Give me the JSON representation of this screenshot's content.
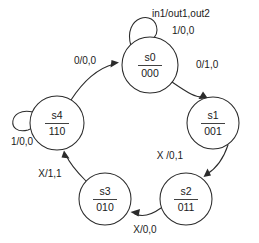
{
  "diagram": {
    "kind": "finite-state-machine",
    "title": "",
    "legend": {
      "format_label": "in1/out1,out2"
    },
    "colors": {
      "stroke": "#2b2b2b",
      "text": "#1a1a1a",
      "background": "#ffffff"
    },
    "states": [
      {
        "id": "s0",
        "name": "s0",
        "code": "000",
        "cx": 150,
        "cy": 65,
        "r": 28
      },
      {
        "id": "s1",
        "name": "s1",
        "code": "001",
        "cx": 213,
        "cy": 123,
        "r": 26
      },
      {
        "id": "s2",
        "name": "s2",
        "code": "011",
        "cx": 186,
        "cy": 199,
        "r": 26
      },
      {
        "id": "s3",
        "name": "s3",
        "code": "010",
        "cx": 105,
        "cy": 199,
        "r": 26
      },
      {
        "id": "s4",
        "name": "s4",
        "code": "110",
        "cx": 57,
        "cy": 123,
        "r": 27
      }
    ],
    "transitions": [
      {
        "id": "t-s0-s0",
        "from": "s0",
        "to": "s0",
        "label": "1/0,0",
        "label_x": 172,
        "label_y": 31,
        "self_loop": true
      },
      {
        "id": "t-s0-s1",
        "from": "s0",
        "to": "s1",
        "label": "0/1,0",
        "label_x": 196,
        "label_y": 65,
        "self_loop": false
      },
      {
        "id": "t-s1-s2",
        "from": "s1",
        "to": "s2",
        "label": "X /0,1",
        "label_x": 183,
        "label_y": 156,
        "self_loop": false
      },
      {
        "id": "t-s2-s3",
        "from": "s2",
        "to": "s3",
        "label": "X/0,0",
        "label_x": 145,
        "label_y": 230,
        "self_loop": false
      },
      {
        "id": "t-s3-s4",
        "from": "s3",
        "to": "s4",
        "label": "X/1,1",
        "label_x": 50,
        "label_y": 174,
        "self_loop": false
      },
      {
        "id": "t-s4-s4",
        "from": "s4",
        "to": "s4",
        "label": "1/0,0",
        "label_x": 22,
        "label_y": 142,
        "self_loop": true
      },
      {
        "id": "t-s4-s0",
        "from": "s4",
        "to": "s0",
        "label": "0/0,0",
        "label_x": 85,
        "label_y": 61,
        "self_loop": false
      }
    ]
  }
}
